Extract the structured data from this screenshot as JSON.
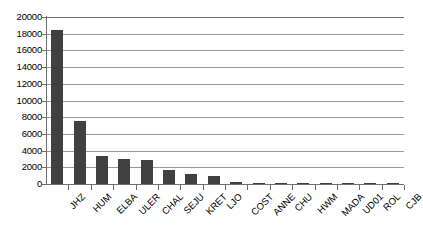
{
  "chart_data": {
    "type": "bar",
    "title": "",
    "subtitle": "",
    "xlabel": "",
    "ylabel": "",
    "ylim": [
      0,
      20000
    ],
    "yticks": [
      0,
      2000,
      4000,
      6000,
      8000,
      10000,
      12000,
      14000,
      16000,
      18000,
      20000
    ],
    "ytick_labels": [
      "0",
      "2000",
      "4000",
      "6000",
      "8000",
      "10000",
      "12000",
      "14000",
      "16000",
      "18000",
      "20000"
    ],
    "grid": "horizontal",
    "legend": "none",
    "bar_color": "#404040",
    "gridline_color": "#9a9a9a",
    "axis_color": "#6e6e6e",
    "background_color": "#ffffff",
    "categories": [
      "JHZ",
      "HUM",
      "ELBA",
      "ULER",
      "CHAL",
      "SEJU",
      "KRET",
      "LJO",
      "COST",
      "ANNE",
      "CHU",
      "HWM",
      "MADA",
      "UD01",
      "ROL",
      "CJB"
    ],
    "values": [
      18400,
      7600,
      3400,
      3050,
      2930,
      1650,
      1230,
      950,
      210,
      90,
      110,
      40,
      35,
      15,
      10,
      5
    ],
    "series": [
      {
        "name": "",
        "values": [
          18400,
          7600,
          3400,
          3050,
          2930,
          1650,
          1230,
          950,
          210,
          90,
          110,
          40,
          35,
          15,
          10,
          5
        ]
      }
    ]
  }
}
